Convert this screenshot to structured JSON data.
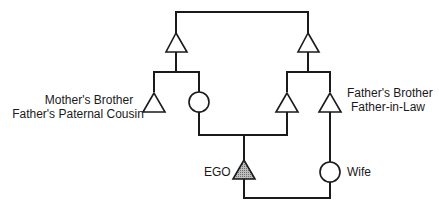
{
  "diagram": {
    "type": "kinship-chart",
    "colors": {
      "line": "#1a1a1a",
      "ego_fill": "#9a9a9a",
      "background": "#ffffff"
    },
    "labels": {
      "left_line1": "Mother's Brother",
      "left_line2": "Father's Paternal Cousin",
      "right_line1": "Father's Brother",
      "right_line2": "Father-in-Law",
      "ego": "EGO",
      "wife": "Wife"
    },
    "nodes": [
      {
        "id": "left-grandparent",
        "symbol": "triangle"
      },
      {
        "id": "right-grandparent",
        "symbol": "triangle"
      },
      {
        "id": "mothers-brother",
        "symbol": "triangle"
      },
      {
        "id": "mother",
        "symbol": "circle"
      },
      {
        "id": "father",
        "symbol": "triangle"
      },
      {
        "id": "fathers-brother",
        "symbol": "triangle"
      },
      {
        "id": "ego",
        "symbol": "triangle-shaded"
      },
      {
        "id": "wife",
        "symbol": "circle"
      }
    ]
  }
}
